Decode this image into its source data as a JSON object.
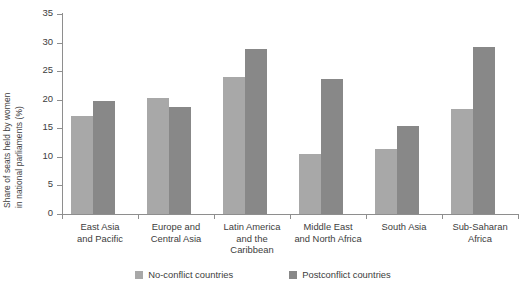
{
  "chart_data": {
    "type": "bar",
    "title": "",
    "xlabel": "",
    "ylabel_line1": "Share of seats held by women",
    "ylabel_line2": "in national parliaments (%)",
    "ylim": [
      0,
      35
    ],
    "ytick_labels": [
      "35",
      "30",
      "25",
      "20",
      "15",
      "10",
      "5",
      "0"
    ],
    "ytick_values": [
      35,
      30,
      25,
      20,
      15,
      10,
      5,
      0
    ],
    "grid": false,
    "legend_position": "bottom-center",
    "categories": [
      "East Asia\nand Pacific",
      "Europe and\nCentral Asia",
      "Latin America\nand the\nCaribbean",
      "Middle East\nand North Africa",
      "South Asia",
      "Sub-Saharan\nAfrica"
    ],
    "series": [
      {
        "name": "No-conflict countries",
        "color": "#a8a8a8",
        "values": [
          17.1,
          20.3,
          23.9,
          10.5,
          11.4,
          18.4
        ]
      },
      {
        "name": "Postconflict countries",
        "color": "#888888",
        "values": [
          19.8,
          18.7,
          28.8,
          23.7,
          15.4,
          29.2
        ]
      }
    ]
  },
  "legend": {
    "items": [
      {
        "label": "No-conflict countries",
        "color": "#a8a8a8"
      },
      {
        "label": "Postconflict countries",
        "color": "#888888"
      }
    ]
  }
}
